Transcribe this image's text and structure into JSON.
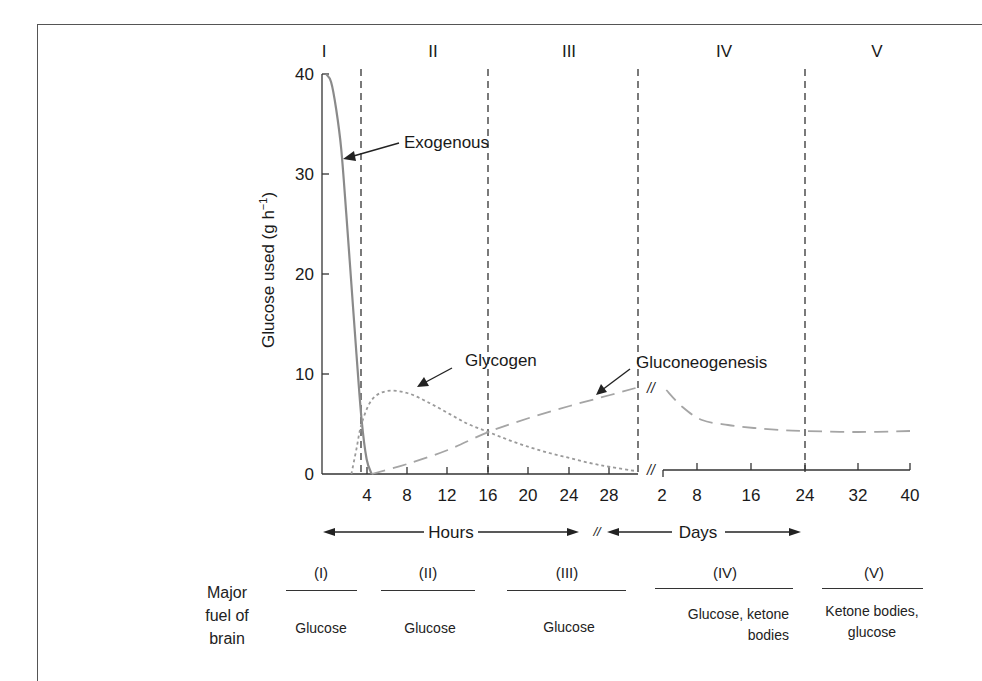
{
  "chart_data": {
    "type": "line",
    "title": "",
    "ylabel": "Glucose used (g h⁻¹)",
    "ylim": [
      0,
      40
    ],
    "yticks": [
      0,
      10,
      20,
      30,
      40
    ],
    "grid": false,
    "phases": [
      "I",
      "II",
      "III",
      "IV",
      "V"
    ],
    "phase_boundaries": [
      {
        "segment": "hours",
        "x": 3.4
      },
      {
        "segment": "hours",
        "x": 16
      },
      {
        "segment": "hours",
        "x": 30.7
      },
      {
        "segment": "days",
        "x": 24
      }
    ],
    "x_segments": [
      {
        "name": "hours",
        "label": "Hours",
        "ticks": [
          4,
          8,
          12,
          16,
          20,
          24,
          28
        ],
        "range": [
          0,
          30.7
        ]
      },
      {
        "name": "days",
        "label": "Days",
        "ticks": [
          2,
          8,
          16,
          24,
          32,
          40
        ],
        "range": [
          2,
          40
        ]
      }
    ],
    "axis_break_mark": "//",
    "series": [
      {
        "name": "Exogenous",
        "style": "solid",
        "color": "#8a8a8a",
        "segment": "hours",
        "points": [
          [
            0,
            40
          ],
          [
            0.5,
            39.2
          ],
          [
            1,
            36.5
          ],
          [
            1.5,
            32.5
          ],
          [
            2,
            26
          ],
          [
            2.5,
            19
          ],
          [
            3,
            12
          ],
          [
            3.5,
            5.5
          ],
          [
            4,
            1.5
          ],
          [
            4.5,
            0
          ]
        ]
      },
      {
        "name": "Glycogen",
        "style": "dotted",
        "color": "#9a9a9a",
        "segment": "hours",
        "points": [
          [
            2.5,
            0
          ],
          [
            3,
            2.5
          ],
          [
            3.5,
            5
          ],
          [
            4.5,
            7.4
          ],
          [
            6,
            8.3
          ],
          [
            8,
            8.1
          ],
          [
            10,
            7.2
          ],
          [
            12,
            6.1
          ],
          [
            14,
            5
          ],
          [
            16,
            4.2
          ],
          [
            18,
            3.4
          ],
          [
            20,
            2.7
          ],
          [
            22,
            2.1
          ],
          [
            24,
            1.6
          ],
          [
            26,
            1.1
          ],
          [
            28,
            0.7
          ],
          [
            30.5,
            0.3
          ]
        ]
      },
      {
        "name": "Gluconeogenesis",
        "style": "dashed",
        "color": "#a5a5a5",
        "segment": "hours",
        "points": [
          [
            4.5,
            0
          ],
          [
            8,
            1
          ],
          [
            12,
            2.4
          ],
          [
            16,
            4.2
          ],
          [
            20,
            5.6
          ],
          [
            24,
            6.8
          ],
          [
            28,
            7.9
          ],
          [
            30.5,
            8.6
          ]
        ]
      },
      {
        "name": "Gluconeogenesis (days)",
        "style": "dashed",
        "color": "#a5a5a5",
        "segment": "days",
        "points": [
          [
            2.5,
            8.4
          ],
          [
            5,
            6.7
          ],
          [
            8,
            5.4
          ],
          [
            12,
            4.9
          ],
          [
            16,
            4.6
          ],
          [
            20,
            4.4
          ],
          [
            24,
            4.3
          ],
          [
            32,
            4.2
          ],
          [
            40,
            4.3
          ]
        ]
      }
    ],
    "annotations": [
      {
        "text": "Exogenous",
        "points_to": "Exogenous"
      },
      {
        "text": "Glycogen",
        "points_to": "Glycogen"
      },
      {
        "text": "Gluconeogenesis",
        "points_to": "Gluconeogenesis"
      }
    ],
    "brain_fuel_table": {
      "row_label": "Major fuel of brain",
      "columns": [
        {
          "phase": "(I)",
          "fuel": "Glucose"
        },
        {
          "phase": "(II)",
          "fuel": "Glucose"
        },
        {
          "phase": "(III)",
          "fuel": "Glucose"
        },
        {
          "phase": "(IV)",
          "fuel": "Glucose, ketone bodies"
        },
        {
          "phase": "(V)",
          "fuel": "Ketone bodies, glucose"
        }
      ]
    }
  },
  "labels": {
    "phases": [
      "I",
      "II",
      "III",
      "IV",
      "V"
    ],
    "ylabel_main": "Glucose used (g h",
    "ylabel_sup": "−1",
    "ylabel_close": ")",
    "yticks": [
      "40",
      "30",
      "20",
      "10",
      "0"
    ],
    "hours_ticks": [
      "4",
      "8",
      "12",
      "16",
      "20",
      "24",
      "28"
    ],
    "days_ticks": [
      "2",
      "8",
      "16",
      "24",
      "32",
      "40"
    ],
    "hours": "Hours",
    "days": "Days",
    "break": "//",
    "exogenous": "Exogenous",
    "glycogen": "Glycogen",
    "gluconeogenesis": "Gluconeogenesis",
    "fuel_row_label": [
      "Major",
      "fuel of",
      "brain"
    ],
    "fuel_phases": [
      "(I)",
      "(II)",
      "(III)",
      "(IV)",
      "(V)"
    ],
    "fuel_values": {
      "p1": [
        "Glucose"
      ],
      "p2": [
        "Glucose"
      ],
      "p3": [
        "Glucose"
      ],
      "p4": [
        "Glucose, ketone",
        "bodies"
      ],
      "p5": [
        "Ketone bodies,",
        "glucose"
      ]
    }
  }
}
